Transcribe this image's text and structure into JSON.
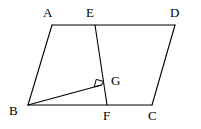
{
  "figure": {
    "type": "geometry-diagram",
    "background_color": "#ffffff",
    "stroke_color": "#000000",
    "canvas": {
      "width": 201,
      "height": 129
    },
    "points": [
      {
        "id": "A",
        "label": "A",
        "x": 52,
        "y": 25
      },
      {
        "id": "E",
        "label": "E",
        "x": 95,
        "y": 25
      },
      {
        "id": "D",
        "label": "D",
        "x": 175,
        "y": 25
      },
      {
        "id": "B",
        "label": "B",
        "x": 28,
        "y": 105
      },
      {
        "id": "F",
        "label": "F",
        "x": 107,
        "y": 105
      },
      {
        "id": "C",
        "label": "C",
        "x": 152,
        "y": 105
      },
      {
        "id": "G",
        "label": "G",
        "x": 101,
        "y": 85
      }
    ],
    "segments": [
      {
        "id": "AD",
        "from": "A",
        "to": "D",
        "name": "top-side-ad"
      },
      {
        "id": "BC",
        "from": "B",
        "to": "C",
        "name": "bottom-side-bc"
      },
      {
        "id": "AB",
        "from": "A",
        "to": "B",
        "name": "left-side-ab"
      },
      {
        "id": "DC",
        "from": "D",
        "to": "C",
        "name": "right-side-dc"
      },
      {
        "id": "EF",
        "from": "E",
        "to": "F",
        "name": "segment-ef"
      },
      {
        "id": "BG",
        "from": "B",
        "to": "G",
        "name": "segment-bg"
      }
    ],
    "right_angle": {
      "at": "G",
      "between": [
        "BG",
        "EF"
      ],
      "marker": "square",
      "size": 8
    }
  }
}
